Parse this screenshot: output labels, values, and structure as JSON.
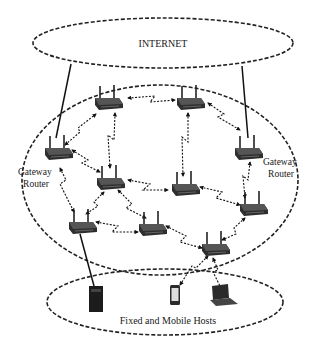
{
  "diagram": {
    "type": "wireless mesh network",
    "clouds": {
      "internet": {
        "label": "INTERNET"
      },
      "mesh": {
        "label": ""
      },
      "hosts": {
        "label": "Fixed and Mobile Hosts"
      }
    },
    "gateway_labels": {
      "left": {
        "line1": "Gateway",
        "line2": "Router"
      },
      "right": {
        "line1": "Gateway",
        "line2": "Router"
      }
    },
    "routers": [
      {
        "id": "R1",
        "role": "gateway-left",
        "x": 58,
        "y": 152
      },
      {
        "id": "R2",
        "role": "mesh-router",
        "x": 108,
        "y": 102
      },
      {
        "id": "R3",
        "role": "mesh-router",
        "x": 190,
        "y": 102
      },
      {
        "id": "R4",
        "role": "gateway-right",
        "x": 248,
        "y": 152
      },
      {
        "id": "R5",
        "role": "mesh-router",
        "x": 110,
        "y": 182
      },
      {
        "id": "R6",
        "role": "mesh-router",
        "x": 185,
        "y": 188
      },
      {
        "id": "R7",
        "role": "mesh-router",
        "x": 253,
        "y": 208
      },
      {
        "id": "R8",
        "role": "mesh-router",
        "x": 82,
        "y": 226
      },
      {
        "id": "R9",
        "role": "mesh-router",
        "x": 152,
        "y": 228
      },
      {
        "id": "R10",
        "role": "mesh-router",
        "x": 215,
        "y": 248
      }
    ],
    "hosts": [
      {
        "id": "H1",
        "kind": "server-tower",
        "x": 95,
        "y": 300
      },
      {
        "id": "H2",
        "kind": "smartphone",
        "x": 175,
        "y": 298
      },
      {
        "id": "H3",
        "kind": "laptop",
        "x": 220,
        "y": 298
      }
    ],
    "wired_links": [
      [
        "internet",
        "R1"
      ],
      [
        "internet",
        "R4"
      ],
      [
        "R8",
        "H1"
      ]
    ],
    "wireless_links": [
      [
        "R1",
        "R2"
      ],
      [
        "R2",
        "R3"
      ],
      [
        "R3",
        "R4"
      ],
      [
        "R1",
        "R5"
      ],
      [
        "R2",
        "R5"
      ],
      [
        "R3",
        "R6"
      ],
      [
        "R5",
        "R6"
      ],
      [
        "R4",
        "R7"
      ],
      [
        "R6",
        "R7"
      ],
      [
        "R1",
        "R8"
      ],
      [
        "R5",
        "R8"
      ],
      [
        "R6",
        "R9"
      ],
      [
        "R8",
        "R9"
      ],
      [
        "R7",
        "R10"
      ],
      [
        "R9",
        "R10"
      ],
      [
        "R10",
        "H2"
      ],
      [
        "R10",
        "H3"
      ]
    ]
  }
}
